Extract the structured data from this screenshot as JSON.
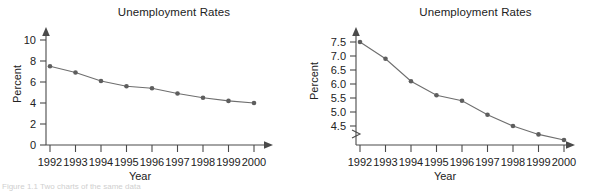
{
  "figure": {
    "caption_fragment": "Figure 1.1 Two charts of the same data"
  },
  "panels": [
    {
      "key": "left",
      "title": "Unemployment Rates",
      "xlabel": "Year",
      "ylabel": "Percent",
      "yticks": [
        "0",
        "2",
        "4",
        "6",
        "8",
        "10"
      ],
      "xticks": [
        "1992",
        "1993",
        "1994",
        "1995",
        "1996",
        "1997",
        "1998",
        "1999",
        "2000"
      ],
      "axis_break": false
    },
    {
      "key": "right",
      "title": "Unemployment Rates",
      "xlabel": "Year",
      "ylabel": "Percent",
      "yticks": [
        "4.5",
        "5.0",
        "5.5",
        "6.0",
        "6.5",
        "7.0",
        "7.5"
      ],
      "xticks": [
        "1992",
        "1993",
        "1994",
        "1995",
        "1996",
        "1997",
        "1998",
        "1999",
        "2000"
      ],
      "axis_break": true
    }
  ],
  "colors": {
    "line": "#6e6e6e",
    "marker": "#5e5e5e",
    "axis": "#4a4a4a",
    "text": "#222222",
    "background": "#ffffff"
  },
  "chart_data": [
    {
      "type": "line",
      "title": "Unemployment Rates",
      "xlabel": "Year",
      "ylabel": "Percent",
      "categories": [
        "1992",
        "1993",
        "1994",
        "1995",
        "1996",
        "1997",
        "1998",
        "1999",
        "2000"
      ],
      "values": [
        7.5,
        6.9,
        6.1,
        5.6,
        5.4,
        4.9,
        4.5,
        4.2,
        4.0
      ],
      "ylim": [
        0,
        10
      ],
      "yticks": [
        0,
        2,
        4,
        6,
        8,
        10
      ],
      "grid": false,
      "legend": "none",
      "axis_break": false
    },
    {
      "type": "line",
      "title": "Unemployment Rates",
      "xlabel": "Year",
      "ylabel": "Percent",
      "categories": [
        "1992",
        "1993",
        "1994",
        "1995",
        "1996",
        "1997",
        "1998",
        "1999",
        "2000"
      ],
      "values": [
        7.5,
        6.9,
        6.1,
        5.6,
        5.4,
        4.9,
        4.5,
        4.2,
        4.0
      ],
      "ylim": [
        4.0,
        7.5
      ],
      "yticks": [
        4.5,
        5.0,
        5.5,
        6.0,
        6.5,
        7.0,
        7.5
      ],
      "grid": false,
      "legend": "none",
      "axis_break": true
    }
  ]
}
